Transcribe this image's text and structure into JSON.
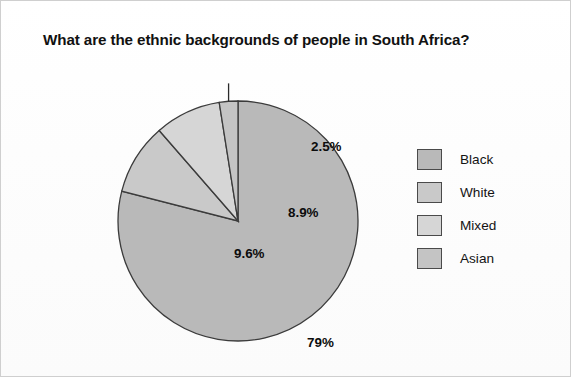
{
  "chart_data": {
    "type": "pie",
    "title": "What are the ethnic backgrounds of people in South Africa?",
    "xlabel": "",
    "ylabel": "",
    "legend_position": "right",
    "grid": false,
    "categories": [
      "Black",
      "White",
      "Mixed",
      "Asian"
    ],
    "values": [
      79,
      9.6,
      8.9,
      2.5
    ],
    "value_labels": [
      "79%",
      "9.6%",
      "8.9%",
      "2.5%"
    ],
    "colors": [
      "#b9b9b9",
      "#c9c9c9",
      "#d6d6d6",
      "#c4c4c4"
    ],
    "slice_border_color": "#3b3b3b",
    "start_angle_deg": 0,
    "direction": "clockwise",
    "annotations": [
      {
        "label": "2.5%",
        "has_leader_line": true
      }
    ]
  },
  "legend": {
    "items": [
      {
        "label": "Black",
        "color": "#b9b9b9"
      },
      {
        "label": "White",
        "color": "#c9c9c9"
      },
      {
        "label": "Mixed",
        "color": "#d6d6d6"
      },
      {
        "label": "Asian",
        "color": "#c4c4c4"
      }
    ]
  },
  "slice_labels": {
    "black": "79%",
    "white": "9.6%",
    "mixed": "8.9%",
    "asian": "2.5%"
  }
}
